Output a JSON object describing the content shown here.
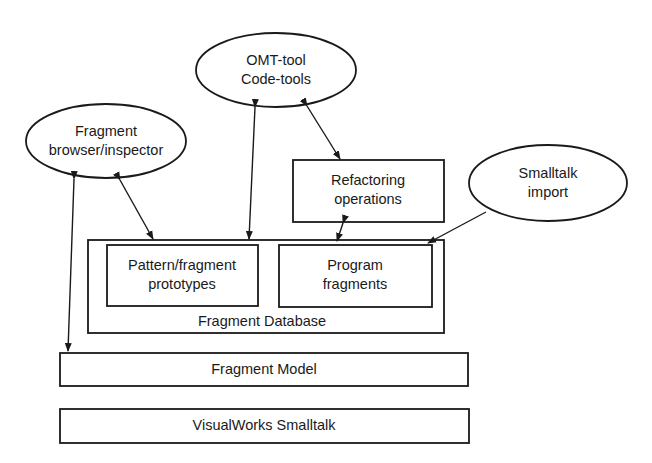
{
  "diagram": {
    "type": "architecture",
    "nodes": {
      "omt_tool": {
        "line1": "OMT-tool",
        "line2": "Code-tools",
        "shape": "ellipse"
      },
      "fragment_browser": {
        "line1": "Fragment",
        "line2": "browser/inspector",
        "shape": "ellipse"
      },
      "smalltalk_import": {
        "line1": "Smalltalk",
        "line2": "import",
        "shape": "ellipse"
      },
      "refactoring": {
        "line1": "Refactoring",
        "line2": "operations",
        "shape": "rectangle"
      },
      "fragment_database": {
        "label": "Fragment Database",
        "shape": "rectangle",
        "contains": [
          "pattern_prototypes",
          "program_fragments"
        ]
      },
      "pattern_prototypes": {
        "line1": "Pattern/fragment",
        "line2": "prototypes",
        "shape": "rectangle"
      },
      "program_fragments": {
        "line1": "Program",
        "line2": "fragments",
        "shape": "rectangle"
      },
      "fragment_model": {
        "label": "Fragment Model",
        "shape": "rectangle"
      },
      "visualworks": {
        "label": "VisualWorks Smalltalk",
        "shape": "rectangle"
      }
    },
    "edges": [
      {
        "from": "fragment_browser",
        "to": "fragment_model",
        "style": "bidirectional"
      },
      {
        "from": "fragment_browser",
        "to": "fragment_database",
        "style": "bidirectional"
      },
      {
        "from": "omt_tool",
        "to": "fragment_database",
        "style": "bidirectional"
      },
      {
        "from": "omt_tool",
        "to": "refactoring",
        "style": "bidirectional"
      },
      {
        "from": "refactoring",
        "to": "fragment_database",
        "style": "bidirectional"
      },
      {
        "from": "smalltalk_import",
        "to": "program_fragments",
        "style": "directed"
      }
    ]
  }
}
